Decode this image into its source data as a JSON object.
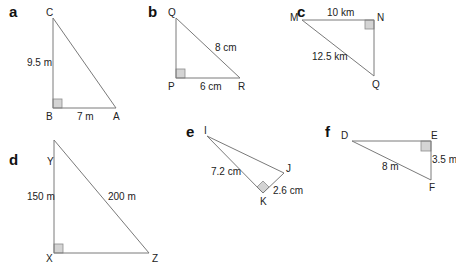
{
  "triangles": [
    {
      "part": "a",
      "vertices": {
        "top": "C",
        "right_angle": "B",
        "end": "A"
      },
      "labels": {
        "vertical_side": "9.5 m",
        "horizontal_side": "7 m"
      }
    },
    {
      "part": "b",
      "vertices": {
        "top": "Q",
        "right_angle": "P",
        "end": "R"
      },
      "labels": {
        "hypotenuse": "8 cm",
        "horizontal_side": "6 cm"
      }
    },
    {
      "part": "c",
      "vertices": {
        "left": "M",
        "right_angle": "N",
        "bottom": "Q"
      },
      "labels": {
        "horizontal_side": "10 km",
        "hypotenuse": "12.5 km"
      }
    },
    {
      "part": "d",
      "vertices": {
        "top": "Y",
        "right_angle": "X",
        "end": "Z"
      },
      "labels": {
        "vertical_side": "150 m",
        "hypotenuse": "200 m"
      }
    },
    {
      "part": "e",
      "vertices": {
        "top": "I",
        "right": "J",
        "right_angle": "K"
      },
      "labels": {
        "side_ik": "7.2 cm",
        "side_jk": "2.6 cm"
      }
    },
    {
      "part": "f",
      "vertices": {
        "left": "D",
        "right_angle": "E",
        "bottom": "F"
      },
      "labels": {
        "hypotenuse": "8 m",
        "vertical_side": "3.5 m"
      }
    }
  ]
}
